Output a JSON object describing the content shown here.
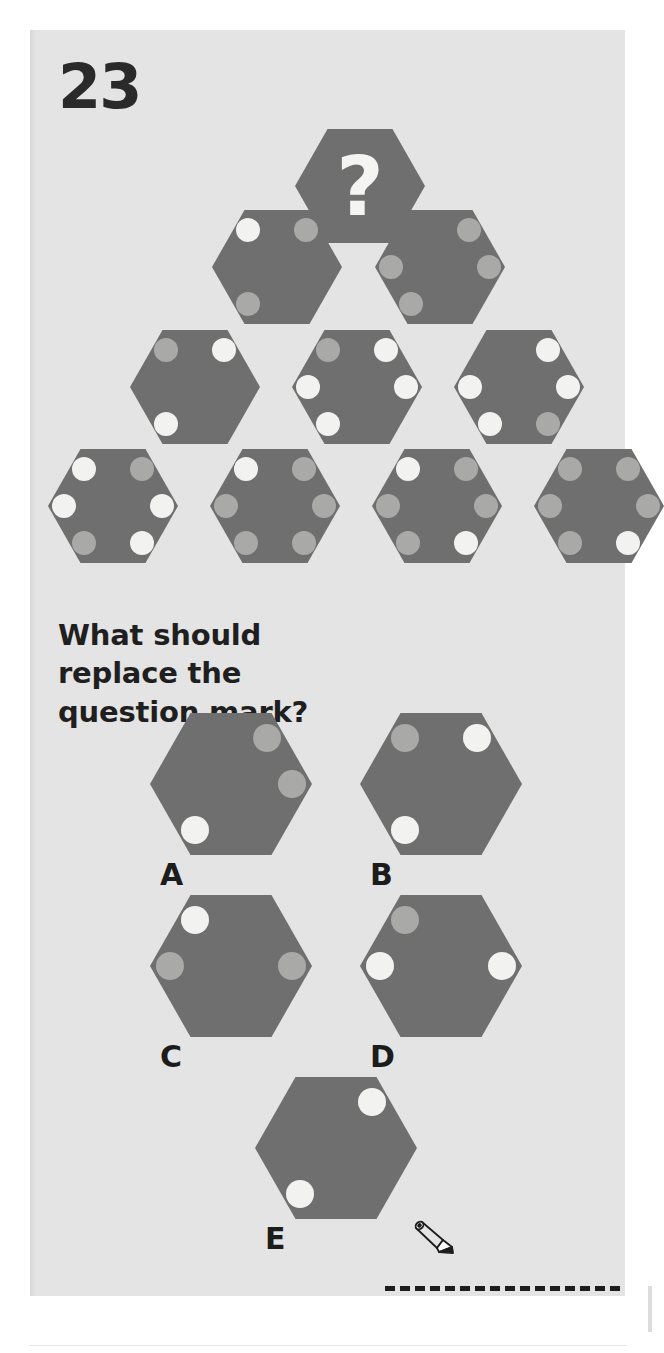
{
  "page": {
    "number": "23",
    "question": "What should replace the question mark?",
    "background_color": "#e3e4e3",
    "hex_color": "#6f6f6f",
    "dot_white": "#f2f2f0",
    "dot_gray": "#a9a9a7",
    "question_glyph": "?"
  },
  "puzzle": {
    "type": "hexagon-dot-sequence",
    "dot_positions": [
      "top-left",
      "top-right",
      "mid-left",
      "mid-right",
      "bottom-left",
      "bottom-right"
    ],
    "rows": [
      {
        "row": 1,
        "hexes": [
          {
            "id": "q",
            "is_question": true,
            "dots": []
          }
        ]
      },
      {
        "row": 2,
        "hexes": [
          {
            "id": "r2h1",
            "is_question": false,
            "dots": [
              {
                "pos": "top-left",
                "color": "white"
              },
              {
                "pos": "top-right",
                "color": "gray"
              },
              {
                "pos": "bottom-left",
                "color": "gray"
              }
            ]
          },
          {
            "id": "r2h2",
            "is_question": false,
            "dots": [
              {
                "pos": "top-right",
                "color": "gray"
              },
              {
                "pos": "mid-left",
                "color": "gray"
              },
              {
                "pos": "mid-right",
                "color": "gray"
              },
              {
                "pos": "bottom-left",
                "color": "gray"
              }
            ]
          }
        ]
      },
      {
        "row": 3,
        "hexes": [
          {
            "id": "r3h1",
            "is_question": false,
            "dots": [
              {
                "pos": "top-left",
                "color": "gray"
              },
              {
                "pos": "top-right",
                "color": "white"
              },
              {
                "pos": "bottom-left",
                "color": "white"
              }
            ]
          },
          {
            "id": "r3h2",
            "is_question": false,
            "dots": [
              {
                "pos": "top-left",
                "color": "gray"
              },
              {
                "pos": "top-right",
                "color": "white"
              },
              {
                "pos": "mid-left",
                "color": "white"
              },
              {
                "pos": "mid-right",
                "color": "white"
              },
              {
                "pos": "bottom-left",
                "color": "white"
              }
            ]
          },
          {
            "id": "r3h3",
            "is_question": false,
            "dots": [
              {
                "pos": "top-right",
                "color": "white"
              },
              {
                "pos": "mid-left",
                "color": "white"
              },
              {
                "pos": "mid-right",
                "color": "white"
              },
              {
                "pos": "bottom-left",
                "color": "white"
              },
              {
                "pos": "bottom-right",
                "color": "gray"
              }
            ]
          }
        ]
      },
      {
        "row": 4,
        "hexes": [
          {
            "id": "r4h1",
            "is_question": false,
            "dots": [
              {
                "pos": "top-left",
                "color": "white"
              },
              {
                "pos": "top-right",
                "color": "gray"
              },
              {
                "pos": "mid-left",
                "color": "white"
              },
              {
                "pos": "mid-right",
                "color": "white"
              },
              {
                "pos": "bottom-left",
                "color": "gray"
              },
              {
                "pos": "bottom-right",
                "color": "white"
              }
            ]
          },
          {
            "id": "r4h2",
            "is_question": false,
            "dots": [
              {
                "pos": "top-left",
                "color": "white"
              },
              {
                "pos": "top-right",
                "color": "gray"
              },
              {
                "pos": "mid-left",
                "color": "gray"
              },
              {
                "pos": "mid-right",
                "color": "gray"
              },
              {
                "pos": "bottom-left",
                "color": "gray"
              },
              {
                "pos": "bottom-right",
                "color": "gray"
              }
            ]
          },
          {
            "id": "r4h3",
            "is_question": false,
            "dots": [
              {
                "pos": "top-left",
                "color": "white"
              },
              {
                "pos": "top-right",
                "color": "gray"
              },
              {
                "pos": "mid-left",
                "color": "gray"
              },
              {
                "pos": "mid-right",
                "color": "gray"
              },
              {
                "pos": "bottom-left",
                "color": "gray"
              },
              {
                "pos": "bottom-right",
                "color": "white"
              }
            ]
          },
          {
            "id": "r4h4",
            "is_question": false,
            "dots": [
              {
                "pos": "top-left",
                "color": "gray"
              },
              {
                "pos": "top-right",
                "color": "gray"
              },
              {
                "pos": "mid-left",
                "color": "gray"
              },
              {
                "pos": "mid-right",
                "color": "gray"
              },
              {
                "pos": "bottom-left",
                "color": "gray"
              },
              {
                "pos": "bottom-right",
                "color": "white"
              }
            ]
          }
        ]
      }
    ]
  },
  "options": [
    {
      "label": "A",
      "dots": [
        {
          "pos": "top-right",
          "color": "gray"
        },
        {
          "pos": "mid-right",
          "color": "gray"
        },
        {
          "pos": "bottom-left",
          "color": "white"
        }
      ]
    },
    {
      "label": "B",
      "dots": [
        {
          "pos": "top-left",
          "color": "gray"
        },
        {
          "pos": "top-right",
          "color": "white"
        },
        {
          "pos": "bottom-left",
          "color": "white"
        }
      ]
    },
    {
      "label": "C",
      "dots": [
        {
          "pos": "top-left",
          "color": "white"
        },
        {
          "pos": "mid-left",
          "color": "gray"
        },
        {
          "pos": "mid-right",
          "color": "gray"
        }
      ]
    },
    {
      "label": "D",
      "dots": [
        {
          "pos": "top-left",
          "color": "gray"
        },
        {
          "pos": "mid-left",
          "color": "white"
        },
        {
          "pos": "mid-right",
          "color": "white"
        }
      ]
    },
    {
      "label": "E",
      "dots": [
        {
          "pos": "top-right",
          "color": "white"
        },
        {
          "pos": "bottom-left",
          "color": "white"
        }
      ]
    }
  ],
  "answer_area": {
    "icon": "pencil-icon",
    "line_style": "dashed"
  }
}
